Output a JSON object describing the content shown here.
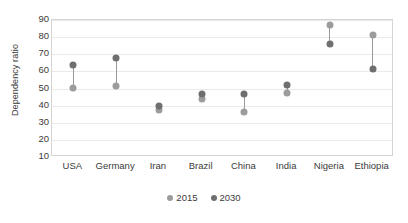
{
  "chart_data": {
    "type": "scatter",
    "title": "",
    "subtitle": "",
    "xlabel": "",
    "ylabel": "Dependency ratio",
    "categories": [
      "USA",
      "Germany",
      "Iran",
      "Brazil",
      "China",
      "India",
      "Nigeria",
      "Ethiopia"
    ],
    "series": [
      {
        "name": "2015",
        "color": "#9c9c9c",
        "values": [
          50.5,
          51.5,
          37.5,
          44,
          36,
          47.5,
          87,
          81
        ]
      },
      {
        "name": "2030",
        "color": "#6f6f6f",
        "values": [
          63.5,
          68,
          40,
          47,
          47,
          52,
          76,
          61.5
        ]
      }
    ],
    "ylim": [
      10,
      90
    ],
    "yticks": [
      10,
      20,
      30,
      40,
      50,
      60,
      70,
      80,
      90
    ],
    "ytick_labels": [
      "10",
      "20",
      "30",
      "40",
      "50",
      "60",
      "70",
      "80",
      "90"
    ],
    "grid": "horizontal",
    "legend_position": "bottom",
    "connectors": true
  },
  "legend": {
    "items": [
      {
        "label": "2015",
        "color": "#9c9c9c"
      },
      {
        "label": "2030",
        "color": "#6f6f6f"
      }
    ]
  },
  "axes": {
    "y_title": "Dependency ratio"
  }
}
